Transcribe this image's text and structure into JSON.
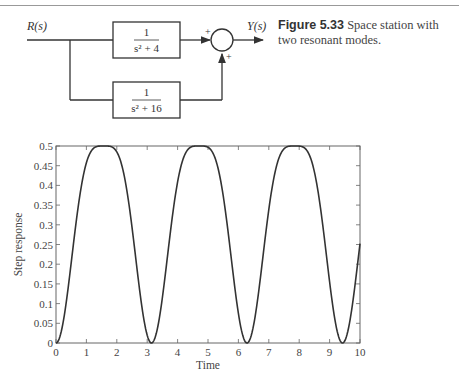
{
  "diagram": {
    "input_label": "R(s)",
    "output_label": "Y(s)",
    "block_top": {
      "numerator": "1",
      "denominator": "s² + 4"
    },
    "block_bottom": {
      "numerator": "1",
      "denominator": "s² + 16"
    },
    "sum_signs": [
      "+",
      "+"
    ]
  },
  "caption": {
    "figure_label": "Figure 5.33",
    "text": "Space station with two resonant modes."
  },
  "chart_data": {
    "type": "line",
    "title": "",
    "xlabel": "Time",
    "ylabel": "Step response",
    "xlim": [
      0,
      10
    ],
    "ylim": [
      0,
      0.5
    ],
    "xticks": [
      0,
      1,
      2,
      3,
      4,
      5,
      6,
      7,
      8,
      9,
      10
    ],
    "yticks": [
      0,
      0.05,
      0.1,
      0.15,
      0.2,
      0.25,
      0.3,
      0.35,
      0.4,
      0.45,
      0.5
    ],
    "ytick_labels": [
      "0",
      "0.05",
      "0.1",
      "0.15",
      "0.2",
      "0.25",
      "0.3",
      "0.35",
      "0.4",
      "0.45",
      "0.5"
    ],
    "grid": false,
    "series": [
      {
        "name": "step response",
        "x": [
          0,
          0.5,
          1,
          1.5,
          1.57,
          2,
          2.5,
          3,
          3.14,
          3.5,
          4,
          4.5,
          4.71,
          5,
          5.5,
          6,
          6.28,
          6.5,
          7,
          7.5,
          7.85,
          8,
          8.5,
          9,
          9.42,
          9.5,
          10
        ],
        "y": [
          0,
          0.17,
          0.42,
          0.49,
          0.5,
          0.49,
          0.36,
          0.03,
          0,
          0.07,
          0.38,
          0.47,
          0.5,
          0.49,
          0.48,
          0.1,
          0,
          0.03,
          0.3,
          0.47,
          0.5,
          0.49,
          0.44,
          0.16,
          0,
          0.004,
          0.25
        ]
      }
    ]
  }
}
